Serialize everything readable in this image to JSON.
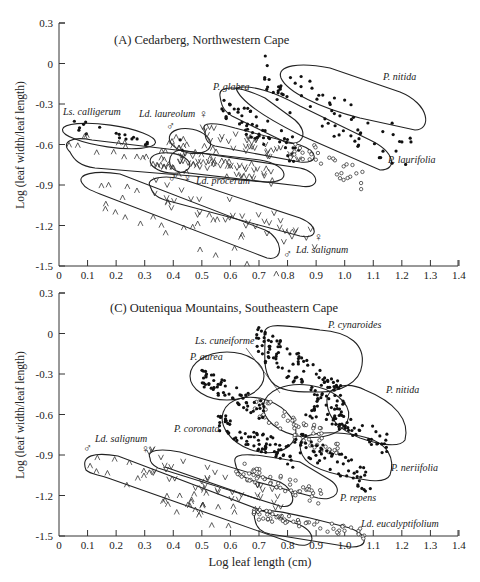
{
  "chart_data": [
    {
      "type": "scatter",
      "panel": "A",
      "title": "(A) Cedarberg, Northwestern Cape",
      "xlabel": "",
      "ylabel": "Log (leaf width/leaf length)",
      "xlim": [
        0,
        1.4
      ],
      "ylim": [
        -1.5,
        0.3
      ],
      "xticks": [
        "0",
        "0.1",
        "0.2",
        "0.3",
        "0.4",
        "0.5",
        "0.6",
        "0.7",
        "0.8",
        "0.9",
        "1.0",
        "1.1",
        "1.2",
        "1.3",
        "1.4"
      ],
      "yticks": [
        "0.3",
        "0",
        "-0.3",
        "-0.6",
        "-0.9",
        "-1.2",
        "-1.5"
      ],
      "grid": false,
      "series": [
        {
          "name": "Ls. calligerum",
          "marker": "filled-circle",
          "x_range": [
            0.02,
            0.45
          ],
          "y_range": [
            -0.62,
            -0.45
          ],
          "label_pos": [
            0.03,
            -0.4
          ]
        },
        {
          "name": "Ls. calligerum (unfilled envelope, ^ markers)",
          "marker": "caret",
          "x_range": [
            0.03,
            0.78
          ],
          "y_range": [
            -0.85,
            -0.58
          ]
        },
        {
          "name": "Ld. laureolum ♂",
          "marker": "caret",
          "x_range": [
            0.38,
            0.62
          ],
          "y_range": [
            -0.72,
            -0.55
          ],
          "label_pos": [
            0.37,
            -0.4
          ]
        },
        {
          "name": "Ld. laureolum ♀",
          "marker": "v",
          "x_range": [
            0.5,
            0.85
          ],
          "y_range": [
            -0.72,
            -0.5
          ]
        },
        {
          "name": "P. glabra",
          "marker": "filled-circle",
          "x_range": [
            0.56,
            0.85
          ],
          "y_range": [
            -0.68,
            -0.3
          ],
          "label_pos": [
            0.62,
            -0.25
          ]
        },
        {
          "name": "P. nitida",
          "marker": "filled-circle",
          "x_range": [
            0.72,
            1.25
          ],
          "y_range": [
            -0.7,
            -0.1
          ],
          "label_pos": [
            1.12,
            -0.13
          ]
        },
        {
          "name": "P. laurifolia",
          "marker": "open-circle",
          "x_range": [
            0.82,
            1.07
          ],
          "y_range": [
            -0.87,
            -0.6
          ],
          "label_pos": [
            1.05,
            -0.68
          ]
        },
        {
          "name": "Ld. procerum ♂",
          "marker": "caret",
          "x_range": [
            0.3,
            0.42
          ],
          "y_range": [
            -0.8,
            -0.7
          ]
        },
        {
          "name": "Ld. procerum ♀",
          "marker": "v",
          "x_range": [
            0.4,
            0.75
          ],
          "y_range": [
            -0.85,
            -0.68
          ],
          "label_pos": [
            0.44,
            -0.86
          ]
        },
        {
          "name": "Ld. salignum ♂",
          "marker": "caret",
          "x_range": [
            0.08,
            0.78
          ],
          "y_range": [
            -1.45,
            -0.92
          ]
        },
        {
          "name": "Ld. salignum ♀",
          "marker": "v",
          "x_range": [
            0.32,
            0.91
          ],
          "y_range": [
            -1.3,
            -0.92
          ],
          "label_pos": [
            0.88,
            -1.43
          ]
        }
      ]
    },
    {
      "type": "scatter",
      "panel": "C",
      "title": "(C) Outeniqua Mountains, Southeastern Cape",
      "xlabel": "Log leaf length (cm)",
      "ylabel": "Log (leaf width/leaf length)",
      "xlim": [
        0,
        1.4
      ],
      "ylim": [
        -1.5,
        0.3
      ],
      "xticks": [
        "0",
        "0.1",
        "0.2",
        "0.3",
        "0.4",
        "0.5",
        "0.6",
        "0.7",
        "0.8",
        "0.9",
        "1.0",
        "1.1",
        "1.2",
        "1.3",
        "1.4"
      ],
      "yticks": [
        "0.3",
        "0",
        "-0.3",
        "-0.6",
        "-0.9",
        "-1.2",
        "-1.5"
      ],
      "grid": false,
      "series": [
        {
          "name": "P. cynaroides",
          "marker": "filled-circle",
          "x_range": [
            0.69,
            1.0
          ],
          "y_range": [
            -0.5,
            -0.05
          ],
          "label_pos": [
            0.86,
            -0.04
          ]
        },
        {
          "name": "Ls. cuneiforme",
          "marker": "open-circle",
          "x_range": [
            0.68,
            0.98
          ],
          "y_range": [
            -0.85,
            -0.52
          ],
          "label_pos": [
            0.52,
            -0.13
          ]
        },
        {
          "name": "P. aurea",
          "marker": "filled-circle",
          "x_range": [
            0.5,
            0.72
          ],
          "y_range": [
            -0.58,
            -0.32
          ],
          "label_pos": [
            0.5,
            -0.23
          ]
        },
        {
          "name": "P. nitida",
          "marker": "filled-circle",
          "x_range": [
            0.86,
            1.15
          ],
          "y_range": [
            -0.82,
            -0.52
          ],
          "label_pos": [
            1.1,
            -0.48
          ]
        },
        {
          "name": "P. coronata",
          "marker": "filled-circle",
          "x_range": [
            0.55,
            0.82
          ],
          "y_range": [
            -0.92,
            -0.64
          ],
          "label_pos": [
            0.38,
            -0.74
          ]
        },
        {
          "name": "P. neriifolia",
          "marker": "filled-circle",
          "x_range": [
            0.82,
            1.09
          ],
          "y_range": [
            -1.1,
            -0.78
          ],
          "label_pos": [
            1.1,
            -0.99
          ]
        },
        {
          "name": "P. repens",
          "marker": "open-circle",
          "x_range": [
            0.62,
            0.93
          ],
          "y_range": [
            -1.22,
            -1.0
          ],
          "label_pos": [
            0.96,
            -1.2
          ]
        },
        {
          "name": "Ld. eucalyptifolium",
          "marker": "open-circle",
          "x_range": [
            0.68,
            1.07
          ],
          "y_range": [
            -1.48,
            -1.33
          ],
          "label_pos": [
            1.03,
            -1.39
          ]
        },
        {
          "name": "Ld. salignum ♂",
          "marker": "caret",
          "x_range": [
            0.1,
            0.62
          ],
          "y_range": [
            -1.38,
            -0.92
          ],
          "label_pos": [
            0.12,
            -0.85
          ]
        },
        {
          "name": "Ld. salignum ♀",
          "marker": "v",
          "x_range": [
            0.31,
            0.79
          ],
          "y_range": [
            -1.28,
            -0.93
          ]
        }
      ]
    }
  ],
  "panels": [
    {
      "title": "(A) Cedarberg, Northwestern Cape",
      "ylabel": "Log (leaf width/leaf length)",
      "labels": {
        "calligerum": "Ls. calligerum",
        "laureolum": "Ld. laureolum",
        "glabra": "P. glabra",
        "nitida": "P. nitida",
        "laurifolia": "P. laurifolia",
        "procerum": "Ld. procerum",
        "salignum": "Ld. salignum"
      },
      "symbols": {
        "male": "♂",
        "female": "♀"
      }
    },
    {
      "title": "(C) Outeniqua Mountains, Southeastern Cape",
      "ylabel": "Log (leaf width/leaf length)",
      "xlabel": "Log leaf length (cm)",
      "labels": {
        "cynaroides": "P. cynaroides",
        "cuneiforme": "Ls. cuneiforme",
        "aurea": "P. aurea",
        "nitida": "P. nitida",
        "coronata": "P. coronata",
        "neriifolia": "P. neriifolia",
        "repens": "P. repens",
        "eucalyptifolium": "Ld. eucalyptifolium",
        "salignum": "Ld. salignum"
      },
      "symbols": {
        "male": "♂",
        "female": "♀"
      }
    }
  ],
  "axis": {
    "xticks": [
      "0",
      "0.1",
      "0.2",
      "0.3",
      "0.4",
      "0.5",
      "0.6",
      "0.7",
      "0.8",
      "0.9",
      "1.0",
      "1.1",
      "1.2",
      "1.3",
      "1.4"
    ],
    "yticks": [
      "0.3",
      "0",
      "-0.3",
      "-0.6",
      "-0.9",
      "-1.2",
      "-1.5"
    ]
  }
}
